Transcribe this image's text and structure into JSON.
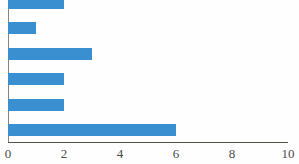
{
  "chart_data": {
    "type": "bar",
    "orientation": "horizontal",
    "title": "",
    "xlabel": "",
    "ylabel": "",
    "categories": [
      "",
      "",
      "",
      "",
      "",
      ""
    ],
    "values": [
      2,
      1,
      3,
      2,
      2,
      6
    ],
    "xlim": [
      0,
      10
    ],
    "xticks": [
      0,
      2,
      4,
      6,
      8,
      10
    ],
    "xtick_labels": [
      "0",
      "2",
      "4",
      "6",
      "8",
      "10"
    ],
    "grid": false,
    "legend": null,
    "series": [
      {
        "name": "",
        "values": [
          2,
          1,
          3,
          2,
          2,
          6
        ]
      }
    ],
    "bar_color": "#3a8fd0",
    "axis_color": "#55524a",
    "background_color": "#fefefe",
    "note": "topmost bar is clipped by the top edge of the image"
  }
}
